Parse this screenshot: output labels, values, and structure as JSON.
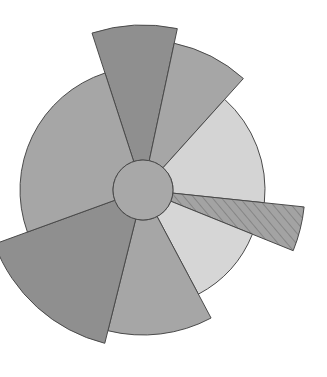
{
  "figure": {
    "background_color": "#ffffff",
    "width": 327,
    "height": 377,
    "title": "",
    "subtitle": ""
  },
  "chart_data": {
    "type": "pie",
    "variant": "nightingale-rose-polar-area",
    "title": "",
    "xlabel": "",
    "ylabel": "",
    "legend": [],
    "grid": false,
    "center": {
      "x": 143,
      "y": 190
    },
    "inner_radius": 30,
    "inner_hole_color": "#a8a8a8",
    "stroke_color": "#4a4a4a",
    "stroke_width": 1,
    "radius_range": [
      118,
      165
    ],
    "categories": [
      "sector-1",
      "sector-2",
      "sector-3",
      "sector-4",
      "sector-5",
      "sector-6",
      "sector-7",
      "sector-8"
    ],
    "values": [
      165,
      150,
      123,
      122,
      145,
      158,
      162,
      157
    ],
    "wedges": [
      {
        "name": "sector-1",
        "start_angle": -108,
        "end_angle": -78,
        "radius": 165,
        "color": "#8f8f8f",
        "hatch": false,
        "label": "sector-1"
      },
      {
        "name": "sector-2",
        "start_angle": -78,
        "end_angle": -48,
        "radius": 150,
        "color": "#a6a6a6",
        "hatch": false,
        "label": "sector-2"
      },
      {
        "name": "sector-3",
        "start_angle": -48,
        "end_angle": 6,
        "radius": 122,
        "color": "#d4d4d4",
        "hatch": false,
        "label": "sector-3"
      },
      {
        "name": "sector-4",
        "start_angle": 6,
        "end_angle": 22,
        "radius": 162,
        "color": "#a3a3a3",
        "hatch": true,
        "label": "sector-4"
      },
      {
        "name": "sector-5",
        "start_angle": 22,
        "end_angle": 62,
        "radius": 118,
        "color": "#d6d6d6",
        "hatch": false,
        "label": "sector-5"
      },
      {
        "name": "sector-6",
        "start_angle": 62,
        "end_angle": 104,
        "radius": 145,
        "color": "#a6a6a6",
        "hatch": false,
        "label": "sector-6"
      },
      {
        "name": "sector-7",
        "start_angle": 104,
        "end_angle": 160,
        "radius": 158,
        "color": "#8f8f8f",
        "hatch": false,
        "label": "sector-7"
      },
      {
        "name": "sector-8",
        "start_angle": 160,
        "end_angle": 252,
        "radius": 123,
        "color": "#a6a6a6",
        "hatch": false,
        "label": "sector-8"
      }
    ],
    "colors": {
      "dark_gray": "#8f8f8f",
      "medium_gray": "#a6a6a6",
      "light_gray": "#d4d4d4",
      "hole_gray": "#a8a8a8",
      "outline": "#4a4a4a"
    }
  }
}
